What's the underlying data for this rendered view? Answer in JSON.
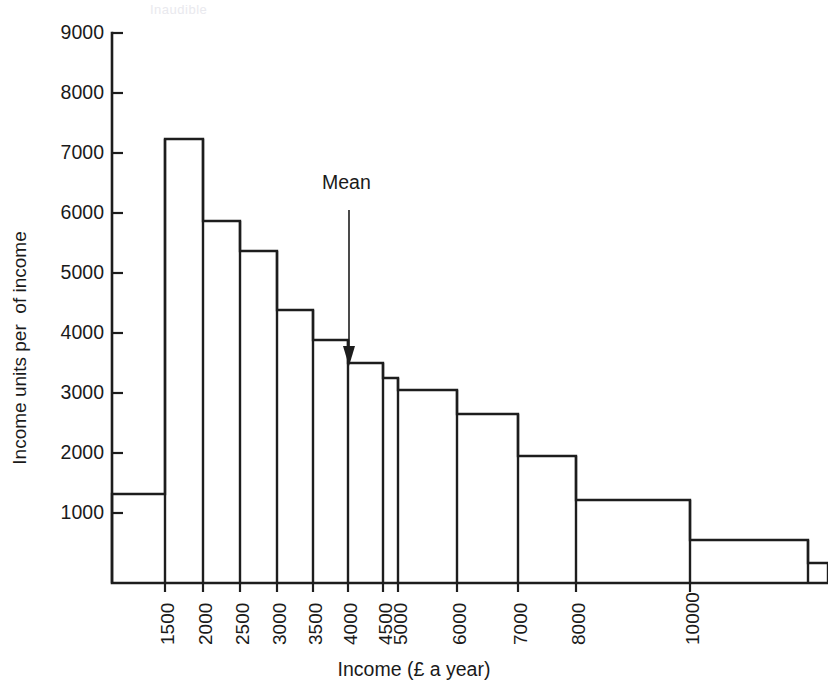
{
  "figure": {
    "y_axis_title": "Income units per  of income",
    "x_axis_title": "Income (£ a year)",
    "mean_annotation": "Mean",
    "ghost_text": "Inaudible",
    "ink_color": "#1d1d1d",
    "background_color": "#ffffff"
  },
  "chart_data": {
    "type": "bar",
    "title": "",
    "subtitle": "",
    "xlabel": "Income (£ a year)",
    "ylabel": "Income units per  of income",
    "grid": false,
    "legend": null,
    "ylim": [
      0,
      9000
    ],
    "xlim": [
      0,
      11000
    ],
    "y_ticks": [
      1000,
      2000,
      3000,
      4000,
      5000,
      6000,
      7000,
      8000,
      9000
    ],
    "y_tick_labels": [
      "1000",
      "2000",
      "3000",
      "4000",
      "5000",
      "6000",
      "7000",
      "8000",
      "9000"
    ],
    "x_ticks": [
      1500,
      2000,
      2500,
      3000,
      3500,
      4000,
      4500,
      5000,
      6000,
      7000,
      8000,
      10000
    ],
    "x_tick_labels": [
      "1500",
      "2000",
      "2500",
      "3000",
      "3500",
      "4000",
      "4500",
      "5000",
      "6000",
      "7000",
      "8000",
      "10000"
    ],
    "bin_edges": [
      0,
      1000,
      1500,
      2000,
      2500,
      3000,
      3500,
      4000,
      4500,
      5000,
      6000,
      7000,
      8000,
      10000,
      11000
    ],
    "categories": [
      "under 1000",
      "1000-1500",
      "1500-2000",
      "2000-2500",
      "2500-3000",
      "3000-3500",
      "3500-4000",
      "4000-4500",
      "4500-5000",
      "5000-6000",
      "6000-7000",
      "7000-8000",
      "8000-10000",
      "over 10000"
    ],
    "values": [
      1420,
      7300,
      5950,
      5450,
      4470,
      3980,
      3650,
      3400,
      3250,
      2840,
      2120,
      1390,
      680,
      250
    ],
    "annotations": [
      {
        "label": "Mean",
        "x": 4150,
        "type": "arrow-down"
      }
    ]
  },
  "geometry": {
    "plot_left": 112,
    "plot_right": 828,
    "plot_bottom": 583,
    "value_zero_y": 583,
    "px_per_1000": 60,
    "y_top_value_y": 33,
    "bin_edge_px": [
      112,
      165,
      203,
      240,
      277,
      313,
      348,
      383,
      398,
      457,
      518,
      576,
      690,
      808,
      828
    ],
    "bar_top_px": [
      494,
      139,
      221,
      251,
      310,
      340,
      363,
      378,
      390,
      414,
      456,
      500,
      540,
      563
    ],
    "x_tick_px": [
      165,
      203,
      240,
      277,
      313,
      348,
      383,
      398,
      457,
      518,
      576,
      690
    ],
    "y_tick_px": [
      513,
      453,
      393,
      333,
      273,
      213,
      153,
      93,
      33
    ],
    "mean_x_px": 349,
    "mean_stem_top_px": 210,
    "mean_stem_bottom_px": 362
  }
}
